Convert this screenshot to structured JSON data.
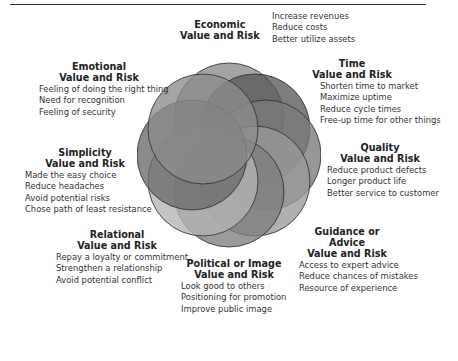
{
  "figure": {
    "title_partial": "Figure — Buying Help: Value and Risk",
    "rosette": {
      "circle_count": 8,
      "colors": [
        "#8a8a8a",
        "#6e6e6e",
        "#555555",
        "#7a7a7a",
        "#999999",
        "#8c8c8c",
        "#b0b0b0",
        "#7c7c7c"
      ]
    }
  },
  "categories": [
    {
      "id": "economic",
      "heading_line1": "Economic",
      "heading_line2": "Value and Risk",
      "items": [
        "Increase revenues",
        "Reduce costs",
        "Better utilize assets"
      ]
    },
    {
      "id": "time",
      "heading_line1": "Time",
      "heading_line2": "Value and Risk",
      "items": [
        "Shorten time to market",
        "Maximize uptime",
        "Reduce cycle times",
        "Free-up time for other things"
      ]
    },
    {
      "id": "quality",
      "heading_line1": "Quality",
      "heading_line2": "Value and Risk",
      "items": [
        "Reduce product defects",
        "Longer product life",
        "Better service to customer"
      ]
    },
    {
      "id": "guidance",
      "heading_line1": "Guidance or Advice",
      "heading_line2": "Value and Risk",
      "items": [
        "Access to expert advice",
        "Reduce chances of mistakes",
        "Resource of experience"
      ]
    },
    {
      "id": "political",
      "heading_line1": "Political or Image",
      "heading_line2": "Value and Risk",
      "items": [
        "Look good to others",
        "Positioning for promotion",
        "Improve public image"
      ]
    },
    {
      "id": "relational",
      "heading_line1": "Relational",
      "heading_line2": "Value and Risk",
      "items": [
        "Repay a loyalty or commitment",
        "Strengthen a relationship",
        "Avoid potential conflict"
      ]
    },
    {
      "id": "simplicity",
      "heading_line1": "Simplicity",
      "heading_line2": "Value and Risk",
      "items": [
        "Made the easy choice",
        "Reduce headaches",
        "Avoid potential risks",
        "Chose path of least resistance"
      ]
    },
    {
      "id": "emotional",
      "heading_line1": "Emotional",
      "heading_line2": "Value and Risk",
      "items": [
        "Feeling of doing the right thing",
        "Need for recognition",
        "Feeling of security"
      ]
    }
  ]
}
